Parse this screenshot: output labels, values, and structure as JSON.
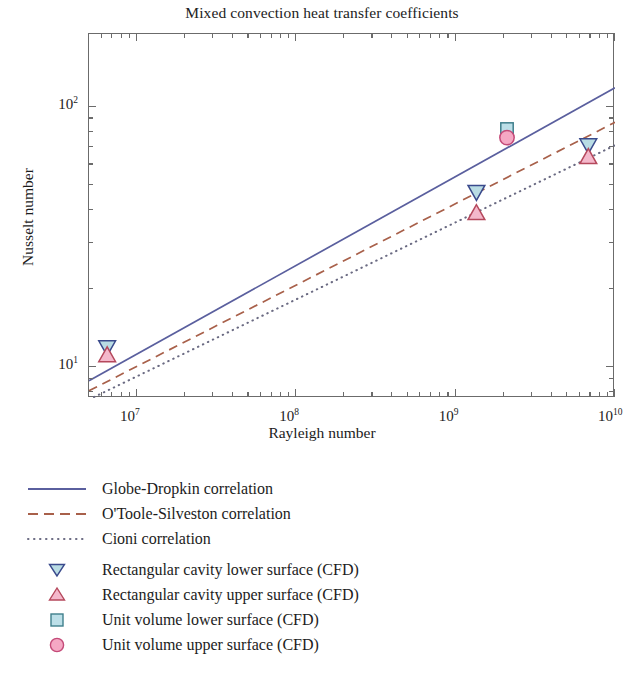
{
  "chart_data": {
    "type": "scatter",
    "title": "Mixed convection heat transfer coefficients",
    "xlabel": "Rayleigh number",
    "ylabel": "Nusselt number",
    "xscale": "log",
    "yscale": "log",
    "xlim": [
      5000000,
      10000000000
    ],
    "ylim": [
      7.6,
      190
    ],
    "grid": false,
    "legend_position": "below-axes",
    "xticks": [
      {
        "value": 10000000,
        "label": "10",
        "exp": "7"
      },
      {
        "value": 100000000,
        "label": "10",
        "exp": "8"
      },
      {
        "value": 1000000000,
        "label": "10",
        "exp": "9"
      },
      {
        "value": 10000000000,
        "label": "10",
        "exp": "10"
      }
    ],
    "yticks": [
      {
        "value": 10,
        "label": "10",
        "exp": "1"
      },
      {
        "value": 100,
        "label": "10",
        "exp": "2"
      }
    ],
    "series": [
      {
        "name": "Globe-Dropkin correlation",
        "kind": "line",
        "style": "solid",
        "color": "#5a5f9e",
        "x": [
          5000000,
          10000000000
        ],
        "y": [
          8.85,
          118.0
        ]
      },
      {
        "name": "O'Toole-Silveston correlation",
        "kind": "line",
        "style": "dashed",
        "color": "#a8604a",
        "x": [
          5000000,
          10000000000
        ],
        "y": [
          8.1,
          87.0
        ]
      },
      {
        "name": "Cioni correlation",
        "kind": "line",
        "style": "dotted",
        "color": "#6a6a82",
        "x": [
          5000000,
          10000000000
        ],
        "y": [
          7.5,
          71.0
        ]
      },
      {
        "name": "Rectangular cavity lower surface (CFD)",
        "kind": "scatter",
        "marker": "triangle-down",
        "fill": "#b9dce4",
        "edge": "#3a4a8c",
        "x": [
          6500000,
          1350000000,
          6800000000
        ],
        "y": [
          11.9,
          47.0,
          71.0
        ]
      },
      {
        "name": "Rectangular cavity upper surface (CFD)",
        "kind": "scatter",
        "marker": "triangle-up",
        "fill": "#f4b8cb",
        "edge": "#b5485c",
        "x": [
          6500000,
          1350000000,
          6800000000
        ],
        "y": [
          11.1,
          39.0,
          64.0
        ]
      },
      {
        "name": "Unit volume lower surface (CFD)",
        "kind": "scatter",
        "marker": "square",
        "fill": "#bcdfe8",
        "edge": "#3f7f8c",
        "x": [
          2100000000
        ],
        "y": [
          82.0
        ]
      },
      {
        "name": "Unit volume upper surface (CFD)",
        "kind": "scatter",
        "marker": "circle",
        "fill": "#f5a8c4",
        "edge": "#c44a78",
        "x": [
          2100000000
        ],
        "y": [
          76.0
        ]
      }
    ]
  },
  "legend": {
    "items": [
      {
        "label": "Globe-Dropkin correlation",
        "key": "line-solid-icon"
      },
      {
        "label": "O'Toole-Silveston correlation",
        "key": "line-dashed-icon"
      },
      {
        "label": "Cioni correlation",
        "key": "line-dotted-icon"
      },
      {
        "label": "Rectangular cavity lower surface (CFD)",
        "key": "triangle-down-marker-icon"
      },
      {
        "label": "Rectangular cavity upper surface (CFD)",
        "key": "triangle-up-marker-icon"
      },
      {
        "label": "Unit volume lower surface (CFD)",
        "key": "square-marker-icon"
      },
      {
        "label": "Unit volume upper surface (CFD)",
        "key": "circle-marker-icon"
      }
    ]
  },
  "axes": {
    "x_title": "Rayleigh number",
    "y_title": "Nusselt number",
    "x_tick_labels": [
      {
        "mantissa": "10",
        "exponent": "7"
      },
      {
        "mantissa": "10",
        "exponent": "8"
      },
      {
        "mantissa": "10",
        "exponent": "9"
      },
      {
        "mantissa": "10",
        "exponent": "10"
      }
    ],
    "y_tick_labels": [
      {
        "mantissa": "10",
        "exponent": "2"
      },
      {
        "mantissa": "10",
        "exponent": "1"
      }
    ]
  }
}
